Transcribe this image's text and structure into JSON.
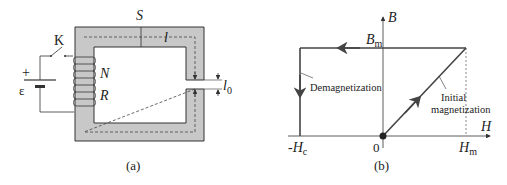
{
  "panel_a": {
    "caption": "(a)",
    "labels": {
      "cross_section": "S",
      "path_length": "l",
      "switch": "K",
      "turns": "N",
      "resistance": "R",
      "emf": "ε",
      "plus": "+",
      "gap": "l",
      "gap_sub": "0"
    }
  },
  "panel_b": {
    "caption": "(b)",
    "axes": {
      "y_label": "B",
      "x_label": "H",
      "origin": "0"
    },
    "ticks": {
      "b_max": "B",
      "b_max_sub": "m",
      "h_max": "H",
      "h_max_sub": "m",
      "h_c_prefix": "-H",
      "h_c_sub": "c"
    },
    "annotations": {
      "demag": "Demagnetization",
      "initial_line1": "Initial",
      "initial_line2": "magnetization"
    }
  },
  "colors": {
    "core_fill": "#c8c8c8",
    "stroke": "#333333",
    "curve": "#444444"
  }
}
